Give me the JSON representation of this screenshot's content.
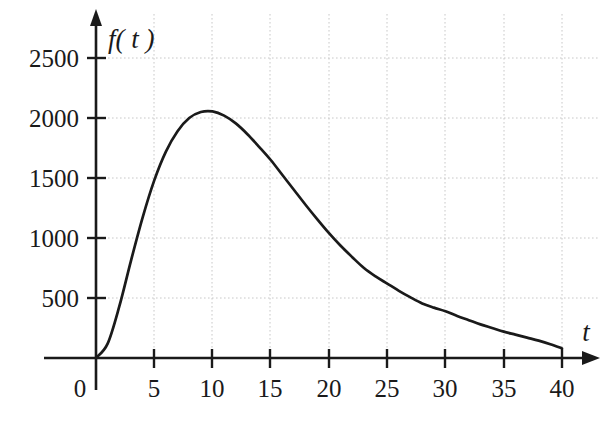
{
  "chart_data": {
    "type": "line",
    "title": "",
    "subtitle": "",
    "xlabel": "t",
    "ylabel": "f( t )",
    "xlim": [
      0,
      42
    ],
    "ylim": [
      0,
      2700
    ],
    "xticks": [
      0,
      5,
      10,
      15,
      20,
      25,
      30,
      35,
      40
    ],
    "xtick_labels": [
      "0",
      "5",
      "10",
      "15",
      "20",
      "25",
      "30",
      "35",
      "40"
    ],
    "yticks": [
      500,
      1000,
      1500,
      2000,
      2500
    ],
    "ytick_labels": [
      "500",
      "1000",
      "1500",
      "2000",
      "2500"
    ],
    "grid": true,
    "grid_style": "dotted",
    "grid_color": "#c8c8c8",
    "legend": null,
    "legend_position": "none",
    "axis_color": "#1a1a1a",
    "curve_color": "#1a1a1a",
    "background_color": "#ffffff",
    "series": [
      {
        "name": "f(t)",
        "x": [
          0,
          1,
          2,
          3,
          4,
          5,
          6,
          7,
          8,
          9,
          10,
          11,
          12,
          13,
          14,
          15,
          16,
          17,
          18,
          19,
          20,
          21,
          22,
          23,
          24,
          25,
          26,
          27,
          28,
          29,
          30,
          31,
          32,
          33,
          34,
          35,
          36,
          37,
          38,
          39,
          40
        ],
        "y": [
          0,
          120,
          430,
          810,
          1170,
          1480,
          1720,
          1890,
          2000,
          2050,
          2055,
          2020,
          1955,
          1865,
          1760,
          1650,
          1525,
          1400,
          1275,
          1155,
          1040,
          935,
          840,
          750,
          680,
          620,
          560,
          505,
          455,
          420,
          390,
          350,
          315,
          280,
          250,
          220,
          195,
          170,
          145,
          115,
          80
        ]
      }
    ],
    "annotations": {
      "peak_t": 10,
      "peak_value": 2050,
      "origin_value": 0,
      "end_t": 40,
      "end_value": 80
    }
  },
  "axes": {
    "y_axis_label": "f( t )",
    "x_axis_label": "t",
    "origin_label": "0",
    "y_arrow": "up-arrow",
    "x_arrow": "right-arrow"
  }
}
